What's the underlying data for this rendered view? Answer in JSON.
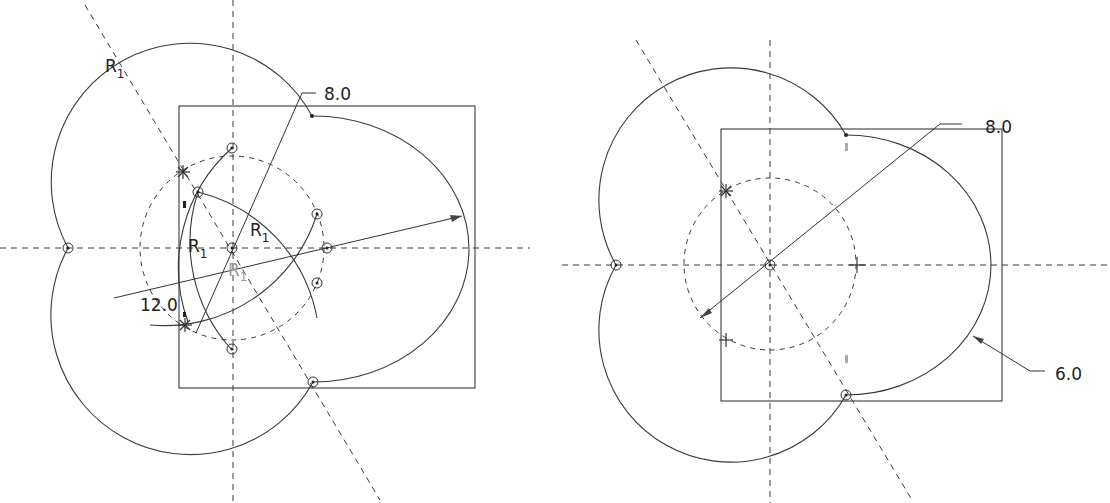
{
  "figures": [
    {
      "id": "left-sketch",
      "dimensions": [
        {
          "label": "8.0",
          "type": "diameter"
        },
        {
          "label": "12.0",
          "type": "diameter"
        }
      ],
      "radius_labels": [
        {
          "main": "R",
          "sub": "1"
        },
        {
          "main": "R",
          "sub": "1"
        },
        {
          "main": "R",
          "sub": "1"
        },
        {
          "main": "R",
          "sub": "1"
        }
      ]
    },
    {
      "id": "right-sketch",
      "dimensions": [
        {
          "label": "8.0",
          "type": "diameter"
        },
        {
          "label": "6.0",
          "type": "radius"
        }
      ]
    }
  ],
  "colors": {
    "line": "#3a3a3a",
    "text": "#222222",
    "background": "#ffffff"
  }
}
